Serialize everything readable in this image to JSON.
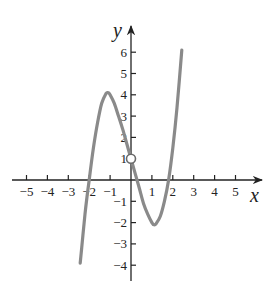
{
  "chart_data": {
    "type": "line",
    "title": "",
    "xlabel": "x",
    "ylabel": "y",
    "xlim": [
      -5.5,
      6
    ],
    "ylim": [
      -4.8,
      7
    ],
    "grid": false,
    "legend": null,
    "x_ticks": [
      -5,
      -4,
      -3,
      -2,
      -1,
      1,
      2,
      3,
      4,
      5
    ],
    "y_ticks": [
      -4,
      -3,
      -2,
      -1,
      1,
      2,
      3,
      4,
      5,
      6
    ],
    "series": [
      {
        "name": "f(x)",
        "color": "#8a8a8a",
        "x": [
          -2.43,
          -2.3,
          -2.2,
          -2.1,
          -2.0,
          -1.8,
          -1.6,
          -1.4,
          -1.2,
          -1.1,
          -1.0,
          -0.8,
          -0.6,
          -0.4,
          -0.2,
          0.0,
          0.2,
          0.4,
          0.6,
          0.8,
          1.0,
          1.1,
          1.2,
          1.4,
          1.6,
          1.8,
          2.0,
          2.2,
          2.43
        ],
        "y": [
          -3.9,
          -2.6,
          -1.6,
          -0.75,
          0.0,
          1.5,
          2.7,
          3.6,
          4.05,
          4.1,
          4.0,
          3.6,
          3.0,
          2.4,
          1.7,
          1.0,
          0.3,
          -0.4,
          -1.1,
          -1.6,
          -2.0,
          -2.1,
          -2.05,
          -1.7,
          -1.0,
          0.0,
          1.5,
          3.4,
          6.1
        ]
      }
    ],
    "annotations": [
      {
        "type": "open-circle",
        "x": 0,
        "y": 1,
        "note": "hole at (0, 1)"
      }
    ]
  }
}
